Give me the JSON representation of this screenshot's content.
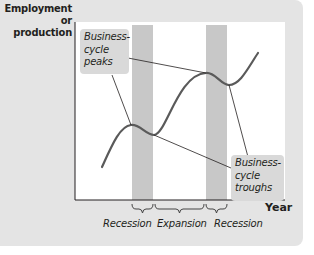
{
  "diagram": {
    "type": "business-cycle",
    "y_axis_label": "Employment or production",
    "y_axis_label_lines": [
      "Employment",
      "or production"
    ],
    "x_axis_label": "Year",
    "callouts": {
      "peaks": {
        "lines": [
          "Business-",
          "cycle",
          "peaks"
        ]
      },
      "troughs": {
        "lines": [
          "Business-",
          "cycle",
          "troughs"
        ]
      }
    },
    "phases": [
      {
        "label": "Recession"
      },
      {
        "label": "Expansion"
      },
      {
        "label": "Recession"
      }
    ],
    "colors": {
      "panel_background": "#e4e4e4",
      "plot_background": "#ffffff",
      "recession_shading": "#c8c8c8",
      "curve": "#5a5a5a",
      "callout_background": "#d9d9d9",
      "leader_lines": "#231f20"
    }
  }
}
